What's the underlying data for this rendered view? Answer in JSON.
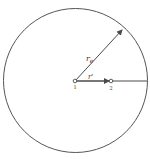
{
  "diagram": {
    "labels": {
      "radius_big": "r",
      "radius_big_sub": "e",
      "radius_small": "r'",
      "point_center": "1",
      "point_two": "2"
    },
    "colors": {
      "stroke": "#4a4a4a",
      "background": "#ffffff"
    },
    "geometry": {
      "circle": {
        "cx": 75.5,
        "cy": 80.5,
        "r": 72
      },
      "point1": {
        "x": 75,
        "y": 81
      },
      "point2": {
        "x": 111,
        "y": 81
      }
    }
  }
}
